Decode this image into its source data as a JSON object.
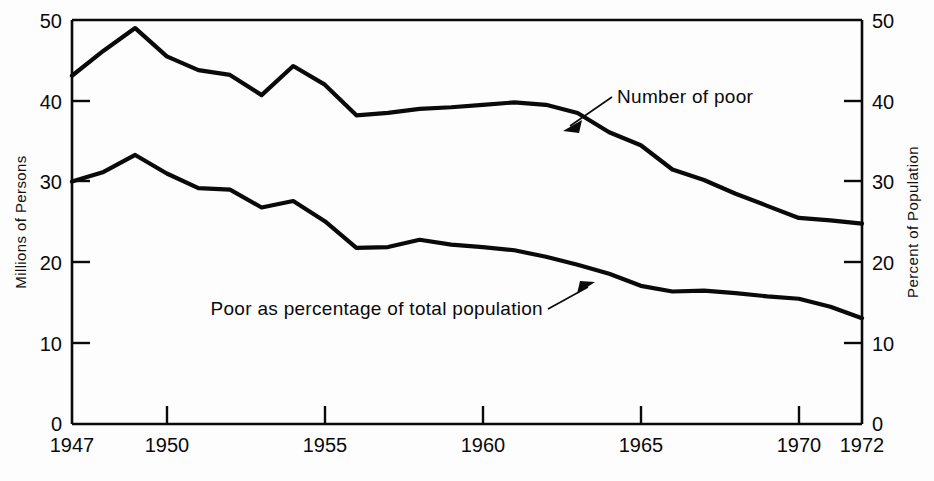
{
  "chart_data": {
    "type": "line",
    "title": "",
    "subtitle": "",
    "xlabel": "",
    "ylabel": "Millions of Persons",
    "y2label": "Percent of Population",
    "xlim": [
      1947,
      1972
    ],
    "ylim": [
      0,
      50
    ],
    "y2lim": [
      0,
      50
    ],
    "grid": false,
    "legend_position": "inline-annotations",
    "x_ticks": [
      1947,
      1950,
      1955,
      1960,
      1965,
      1970,
      1972
    ],
    "x_tick_labels": [
      "1947",
      "1950",
      "1955",
      "1960",
      "1965",
      "1970",
      "1972"
    ],
    "y_ticks": [
      0,
      10,
      20,
      30,
      40,
      50
    ],
    "y_tick_labels": [
      "0",
      "10",
      "20",
      "30",
      "40",
      "50"
    ],
    "y2_ticks": [
      0,
      10,
      20,
      30,
      40,
      50
    ],
    "y2_tick_labels": [
      "0",
      "10",
      "20",
      "30",
      "40",
      "50"
    ],
    "x": [
      1947,
      1948,
      1949,
      1950,
      1951,
      1952,
      1953,
      1954,
      1955,
      1956,
      1957,
      1958,
      1959,
      1960,
      1961,
      1962,
      1963,
      1964,
      1965,
      1966,
      1967,
      1968,
      1969,
      1970,
      1971,
      1972
    ],
    "series": [
      {
        "name": "Number of poor",
        "unit": "millions",
        "axis": "left",
        "values": [
          43.1,
          46.2,
          49.0,
          45.5,
          43.8,
          43.2,
          40.7,
          44.3,
          42.0,
          38.2,
          38.5,
          39.0,
          39.2,
          39.5,
          39.8,
          39.5,
          38.5,
          36.1,
          34.5,
          31.5,
          30.2,
          28.5,
          27.0,
          25.5,
          25.2,
          24.8
        ]
      },
      {
        "name": "Poor as percentage of total population",
        "unit": "percent",
        "axis": "right",
        "values": [
          30.0,
          31.2,
          33.3,
          31.0,
          29.2,
          29.0,
          26.8,
          27.6,
          25.1,
          21.8,
          21.9,
          22.8,
          22.2,
          21.9,
          21.5,
          20.7,
          19.7,
          18.6,
          17.1,
          16.4,
          16.5,
          16.2,
          15.8,
          15.5,
          14.5,
          13.1
        ]
      }
    ],
    "annotations": [
      {
        "text": "Number of poor",
        "target_series": "Number of poor",
        "arrow": "down-left"
      },
      {
        "text": "Poor as percentage of total population",
        "target_series": "Poor as percentage of total population",
        "arrow": "up-right"
      }
    ],
    "colors": {
      "line": "#0a0a0a",
      "axis": "#0a0a0a",
      "background": "#fdfdfd"
    }
  }
}
